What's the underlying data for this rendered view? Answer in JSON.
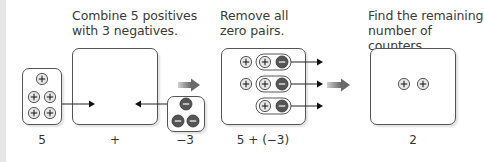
{
  "steps": [
    {
      "title_line1": "Combine 5 positives",
      "title_line2": "with 3 negatives."
    },
    {
      "title_line1": "Remove all",
      "title_line2": "zero pairs."
    },
    {
      "title_line1": "Find the remaining",
      "title_line2": "number of counters."
    }
  ],
  "labels": {
    "positives_count": "5",
    "plus_sign": "+",
    "negatives_count": "−3",
    "expression": "5 + (−3)",
    "result": "2"
  },
  "counters": {
    "positive_symbol": "+",
    "negative_symbol": "−",
    "positive_fill": "#e8e8e8",
    "negative_fill": "#555555"
  },
  "groups": {
    "initial_positives": 5,
    "initial_negatives": 3,
    "zero_pairs": 3,
    "remaining_positives": 2
  }
}
